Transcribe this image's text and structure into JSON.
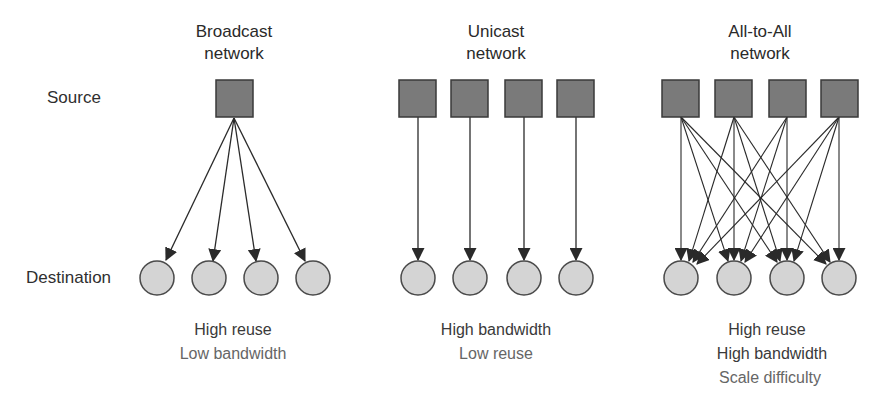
{
  "row_labels": {
    "source": "Source",
    "destination": "Destination"
  },
  "networks": [
    {
      "id": "broadcast",
      "title_line1": "Broadcast",
      "title_line2": "network",
      "captions": [
        "High reuse",
        "Low bandwidth"
      ],
      "sources": 1,
      "destinations": 4,
      "connectivity": "one-to-all"
    },
    {
      "id": "unicast",
      "title_line1": "Unicast",
      "title_line2": "network",
      "captions": [
        "High bandwidth",
        "Low reuse"
      ],
      "sources": 4,
      "destinations": 4,
      "connectivity": "one-to-one"
    },
    {
      "id": "all-to-all",
      "title_line1": "All-to-All",
      "title_line2": "network",
      "captions": [
        "High reuse",
        "High bandwidth",
        "Scale difficulty"
      ],
      "sources": 4,
      "destinations": 4,
      "connectivity": "all-to-all"
    }
  ],
  "colors": {
    "source_fill": "#7a7a7a",
    "source_stroke": "#3a3a3a",
    "dest_fill": "#d4d4d4",
    "dest_stroke": "#4a4a4a",
    "edge": "#2a2a2a"
  }
}
